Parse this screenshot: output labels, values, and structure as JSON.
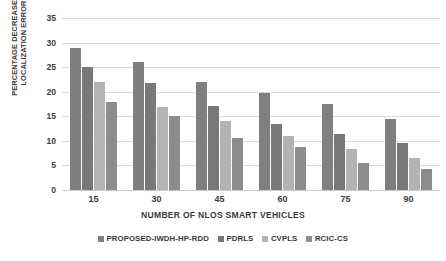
{
  "chart_data": {
    "type": "bar",
    "title": "",
    "xlabel": "NUMBER OF NLOS SMART VEHICLES",
    "ylabel": "PERCENTAGE DECREASE IN LOCALIZATION ERROR",
    "ylabel_lines": [
      "PERCENTAGE DECREASE IN",
      "LOCALIZATION ERROR"
    ],
    "categories": [
      "15",
      "30",
      "45",
      "60",
      "75",
      "90"
    ],
    "yticks": [
      "0",
      "5",
      "10",
      "15",
      "20",
      "25",
      "30",
      "35"
    ],
    "ylim": [
      0,
      35
    ],
    "grid": true,
    "legend_position": "bottom-center",
    "series": [
      {
        "name": "PROPOSED-IWDH-HP-RDD",
        "color": "#7f7f7f",
        "values": [
          29,
          26,
          22,
          19.8,
          17.5,
          14.5
        ]
      },
      {
        "name": "PDRLS",
        "color": "#787878",
        "values": [
          25,
          21.8,
          17,
          13.5,
          11.5,
          9.5
        ]
      },
      {
        "name": "CVPLS",
        "color": "#b3b3b3",
        "values": [
          22,
          16.8,
          14,
          11,
          8.3,
          6.5
        ]
      },
      {
        "name": "RCIC-CS",
        "color": "#8c8c8c",
        "values": [
          18,
          15,
          10.5,
          8.8,
          5.5,
          4.3
        ]
      }
    ]
  }
}
